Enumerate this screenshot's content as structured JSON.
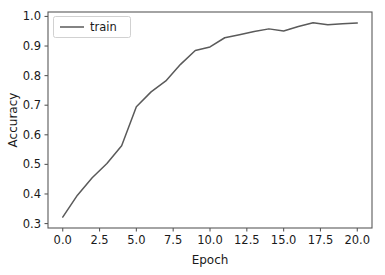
{
  "chart_data": {
    "type": "line",
    "title": "",
    "xlabel": "Epoch",
    "ylabel": "Accuracy",
    "xlim": [
      -1.0,
      21.0
    ],
    "ylim": [
      0.285,
      1.015
    ],
    "grid": false,
    "legend_position": "upper left",
    "xticks": [
      "0.0",
      "2.5",
      "5.0",
      "7.5",
      "10.0",
      "12.5",
      "15.0",
      "17.5",
      "20.0"
    ],
    "xtick_values": [
      0.0,
      2.5,
      5.0,
      7.5,
      10.0,
      12.5,
      15.0,
      17.5,
      20.0
    ],
    "yticks": [
      "0.3",
      "0.4",
      "0.5",
      "0.6",
      "0.7",
      "0.8",
      "0.9",
      "1.0"
    ],
    "ytick_values": [
      0.3,
      0.4,
      0.5,
      0.6,
      0.7,
      0.8,
      0.9,
      1.0
    ],
    "series": [
      {
        "name": "train",
        "color": "#5a5a5a",
        "x": [
          0,
          1,
          2,
          3,
          4,
          5,
          6,
          7,
          8,
          9,
          10,
          11,
          12,
          13,
          14,
          15,
          16,
          17,
          18,
          19,
          20
        ],
        "values": [
          0.322,
          0.396,
          0.455,
          0.503,
          0.563,
          0.695,
          0.745,
          0.782,
          0.838,
          0.885,
          0.897,
          0.928,
          0.938,
          0.949,
          0.958,
          0.951,
          0.966,
          0.979,
          0.972,
          0.975,
          0.978
        ]
      }
    ]
  },
  "legend": {
    "entries": [
      {
        "label": "train"
      }
    ]
  },
  "axes": {
    "x_title": "Epoch",
    "y_title": "Accuracy"
  }
}
